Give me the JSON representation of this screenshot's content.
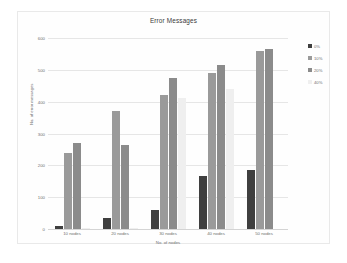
{
  "chart_data": {
    "type": "bar",
    "title": "Error Messages",
    "xlabel": "No. of nodes",
    "ylabel": "No. of error messages",
    "categories": [
      "10 nodes",
      "20 nodes",
      "30 nodes",
      "40 nodes",
      "50 nodes"
    ],
    "yticks": [
      0,
      100,
      200,
      300,
      400,
      500,
      600
    ],
    "ylim": [
      0,
      600
    ],
    "grid": true,
    "legend_position": "right",
    "series": [
      {
        "name": "0%",
        "color": "#3f3f3f",
        "values": [
          8,
          35,
          60,
          165,
          185
        ]
      },
      {
        "name": "10%",
        "color": "#9a9a9a",
        "values": [
          240,
          370,
          420,
          490,
          560
        ]
      },
      {
        "name": "20%",
        "color": "#8b8b8b",
        "values": [
          270,
          265,
          475,
          515,
          565
        ]
      },
      {
        "name": "40%",
        "color": "#efefef",
        "values": [
          2,
          2,
          410,
          440,
          0
        ]
      }
    ]
  },
  "colors": {
    "frame_border": "#e9e9e9",
    "gridline": "#e6e6e6",
    "axis_text": "#6e6e6e",
    "title_text": "#3a3a3a",
    "background": "#ffffff"
  }
}
